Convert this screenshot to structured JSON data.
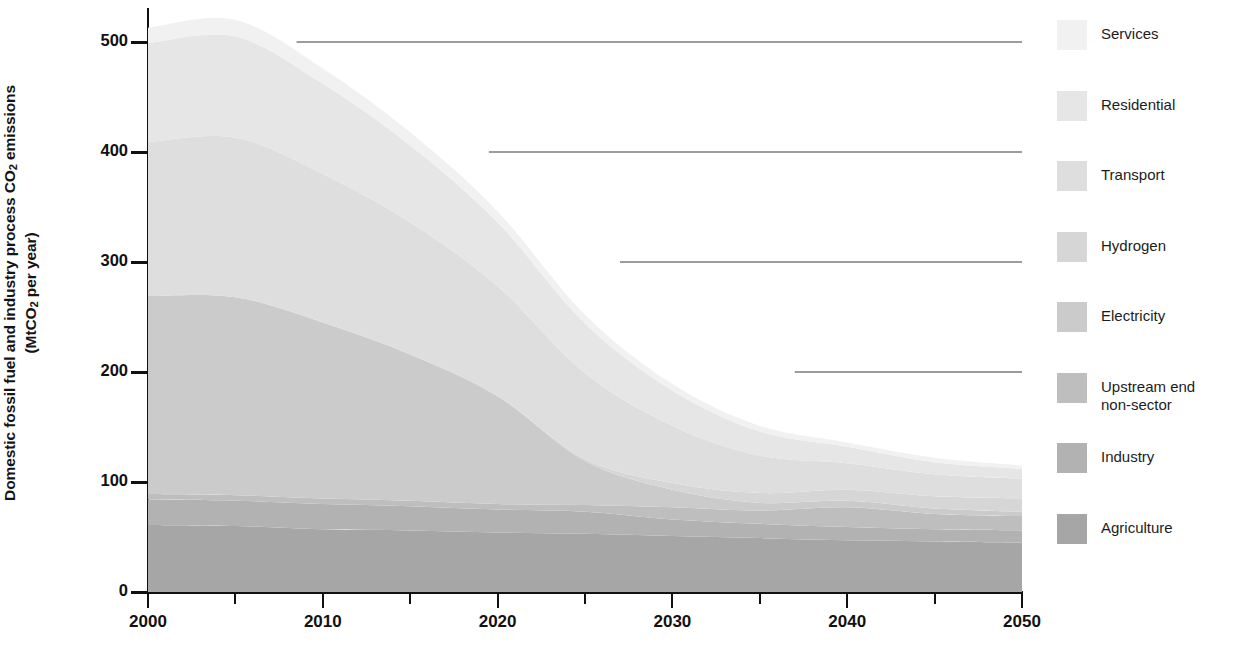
{
  "axes": {
    "y_title_line1": "Domestic fossil fuel and industry process CO",
    "y_title_sub": "2",
    "y_title_line1b": " emissions",
    "y_title_line2a": "(MtCO",
    "y_title_sub2": "2",
    "y_title_line2b": " per year)",
    "y_ticks": [
      "0",
      "100",
      "200",
      "300",
      "400",
      "500"
    ],
    "x_ticks": [
      "2000",
      "2010",
      "2020",
      "2030",
      "2040",
      "2050"
    ]
  },
  "legend": {
    "items": [
      {
        "label": "Services",
        "color": "#f1f1f1"
      },
      {
        "label": "Residential",
        "color": "#e6e6e6"
      },
      {
        "label": "Transport",
        "color": "#dedede"
      },
      {
        "label": "Hydrogen",
        "color": "#d6d6d6"
      },
      {
        "label": "Electricity",
        "color": "#cbcbcb"
      },
      {
        "label": "Upstream end\nnon-sector",
        "color": "#bebebe"
      },
      {
        "label": "Industry",
        "color": "#b2b2b2"
      },
      {
        "label": "Agriculture",
        "color": "#a6a6a6"
      }
    ]
  },
  "chart_data": {
    "type": "area",
    "stacked": true,
    "title": "",
    "xlabel": "",
    "ylabel": "Domestic fossil fuel and industry process CO2 emissions (MtCO2 per year)",
    "xlim": [
      2000,
      2050
    ],
    "ylim": [
      0,
      530
    ],
    "yticks": [
      0,
      100,
      200,
      300,
      400,
      500
    ],
    "xticks": [
      2000,
      2010,
      2020,
      2030,
      2040,
      2050
    ],
    "xminor_step": 5,
    "grid": "horizontal-partial",
    "gridlines": [
      {
        "value": 500,
        "start_x": 2008.5,
        "end_x": 2050
      },
      {
        "value": 400,
        "start_x": 2019.5,
        "end_x": 2050
      },
      {
        "value": 300,
        "start_x": 2027.0,
        "end_x": 2050
      },
      {
        "value": 200,
        "start_x": 2037.0,
        "end_x": 2050
      }
    ],
    "legend_position": "right",
    "x": [
      2000,
      2005,
      2010,
      2015,
      2020,
      2025,
      2030,
      2035,
      2040,
      2045,
      2050
    ],
    "series": [
      {
        "name": "Agriculture",
        "color": "#a6a6a6",
        "values": [
          61,
          60,
          57,
          56,
          54,
          53,
          51,
          49,
          47,
          46,
          45
        ]
      },
      {
        "name": "Industry",
        "color": "#b2b2b2",
        "values": [
          23,
          23,
          23,
          22,
          21,
          20,
          15,
          13,
          12,
          11,
          11
        ]
      },
      {
        "name": "Upstream end non-sector",
        "color": "#bebebe",
        "values": [
          5,
          5,
          5,
          5,
          5,
          6,
          11,
          12,
          18,
          14,
          13
        ]
      },
      {
        "name": "Electricity",
        "color": "#cbcbcb",
        "values": [
          180,
          180,
          160,
          133,
          98,
          40,
          16,
          7,
          6,
          5,
          4
        ]
      },
      {
        "name": "Hydrogen",
        "color": "#d6d6d6",
        "values": [
          0,
          0,
          0,
          0,
          0,
          2,
          6,
          9,
          10,
          11,
          12
        ]
      },
      {
        "name": "Transport",
        "color": "#dedede",
        "values": [
          140,
          145,
          135,
          120,
          100,
          78,
          52,
          34,
          24,
          20,
          18
        ]
      },
      {
        "name": "Residential",
        "color": "#e6e6e6",
        "values": [
          90,
          92,
          82,
          70,
          58,
          45,
          32,
          22,
          15,
          11,
          9
        ]
      },
      {
        "name": "Services",
        "color": "#f1f1f1",
        "values": [
          14,
          15,
          14,
          12,
          10,
          8,
          6,
          5,
          4,
          4,
          3
        ]
      }
    ]
  }
}
